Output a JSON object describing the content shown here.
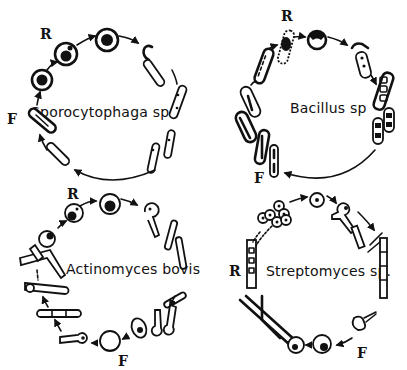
{
  "figure": {
    "panels": [
      {
        "id": "sporocytophaga",
        "species": "Sporocytophaga sp.",
        "markers": {
          "R": "R",
          "F": "F"
        }
      },
      {
        "id": "bacillus",
        "species": "Bacillus sp",
        "markers": {
          "R": "R",
          "F": "F"
        }
      },
      {
        "id": "actinomyces",
        "species": "Actinomyces bovis",
        "markers": {
          "R": "R",
          "F": "F"
        }
      },
      {
        "id": "streptomyces",
        "species": "Streptomyces sp.",
        "markers": {
          "R": "R",
          "F": "F"
        }
      }
    ]
  },
  "colors": {
    "ink": "#111111",
    "background": "#ffffff"
  }
}
